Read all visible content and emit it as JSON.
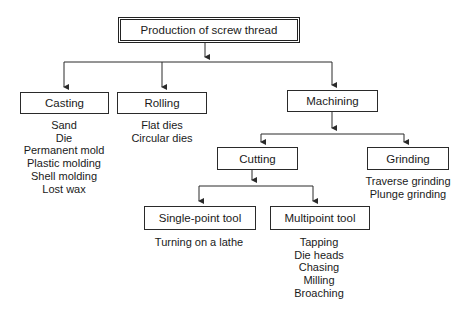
{
  "title": "Production of screw thread",
  "nodes": {
    "root": {
      "label": "Production of screw thread"
    },
    "casting": {
      "label": "Casting",
      "items": [
        "Sand",
        "Die",
        "Permanent mold",
        "Plastic molding",
        "Shell molding",
        "Lost wax"
      ]
    },
    "rolling": {
      "label": "Rolling",
      "items": [
        "Flat dies",
        "Circular dies"
      ]
    },
    "machining": {
      "label": "Machining"
    },
    "cutting": {
      "label": "Cutting"
    },
    "grinding": {
      "label": "Grinding",
      "items": [
        "Traverse grinding",
        "Plunge grinding"
      ]
    },
    "single_point": {
      "label": "Single-point tool",
      "items": [
        "Turning on a lathe"
      ]
    },
    "multipoint": {
      "label": "Multipoint tool",
      "items": [
        "Tapping",
        "Die heads",
        "Chasing",
        "Milling",
        "Broaching"
      ]
    }
  },
  "edges": [
    [
      "root",
      "casting"
    ],
    [
      "root",
      "rolling"
    ],
    [
      "root",
      "machining"
    ],
    [
      "machining",
      "cutting"
    ],
    [
      "machining",
      "grinding"
    ],
    [
      "cutting",
      "single_point"
    ],
    [
      "cutting",
      "multipoint"
    ]
  ],
  "colors": {
    "line": "#2a2a2a",
    "background": "#ffffff",
    "text": "#1a1a1a"
  }
}
